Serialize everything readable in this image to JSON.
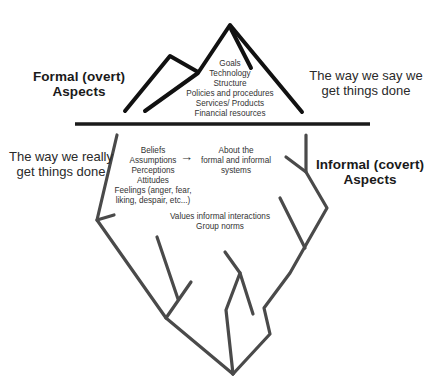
{
  "diagram": {
    "type": "iceberg",
    "colors": {
      "mountain_stroke": "#111111",
      "waterline": "#1a1a1a",
      "iceberg_stroke": "#4a4a4a",
      "background": "#ffffff"
    },
    "above_water": {
      "heading": {
        "line1": "Formal (overt)",
        "line2": "Aspects"
      },
      "side_caption": {
        "line1": "The way we say we",
        "line2": "get things done"
      },
      "items": [
        "Goals",
        "Technology",
        "Structure",
        "Policies and procedures",
        "Services/ Products",
        "Financial resources"
      ]
    },
    "below_water": {
      "heading": {
        "line1": "Informal (covert)",
        "line2": "Aspects"
      },
      "side_caption": {
        "line1": "The way we really",
        "line2": "get things done"
      },
      "items": [
        "Beliefs",
        "Assumptions",
        "Perceptions",
        "Attitudes",
        "Feelings (anger, fear,",
        "liking, despair, etc...)"
      ],
      "arrow_symbol": "→",
      "arrow_target": {
        "line1": "About the",
        "line2": "formal and informal",
        "line3": "systems"
      },
      "extra_items": [
        "Values informal interactions",
        "Group norms"
      ]
    }
  }
}
